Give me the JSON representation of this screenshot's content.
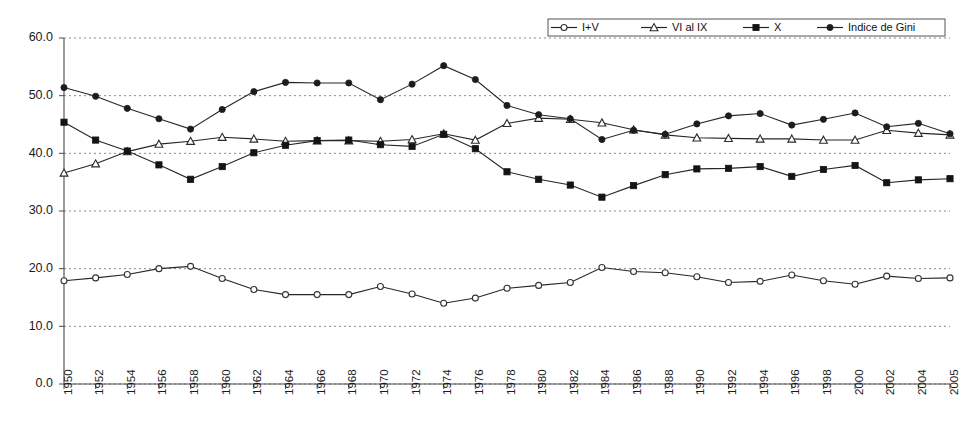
{
  "chart_data": {
    "type": "line",
    "title": "",
    "subtitle": "",
    "xlabel": "",
    "ylabel": "",
    "ylim": [
      0,
      60
    ],
    "yticks": [
      "0.0",
      "10.0",
      "20.0",
      "30.0",
      "40.0",
      "50.0",
      "60.0"
    ],
    "ytick_values": [
      0,
      10,
      20,
      30,
      40,
      50,
      60
    ],
    "grid": "horizontal-dashed",
    "legend_position": "top-right",
    "x": [
      "1950",
      "1952",
      "1954",
      "1956",
      "1958",
      "1960",
      "1962",
      "1964",
      "1966",
      "1968",
      "1970",
      "1972",
      "1974",
      "1976",
      "1978",
      "1980",
      "1982",
      "1984",
      "1986",
      "1988",
      "1990",
      "1992",
      "1994",
      "1996",
      "1998",
      "2000",
      "2002",
      "2004",
      "2005"
    ],
    "categories": [
      "1950",
      "1952",
      "1954",
      "1956",
      "1958",
      "1960",
      "1962",
      "1964",
      "1966",
      "1968",
      "1970",
      "1972",
      "1974",
      "1976",
      "1978",
      "1980",
      "1982",
      "1984",
      "1986",
      "1988",
      "1990",
      "1992",
      "1994",
      "1996",
      "1998",
      "2000",
      "2002",
      "2004",
      "2005"
    ],
    "series": [
      {
        "name": "I+V",
        "marker": "open-circle",
        "values": [
          17.9,
          18.4,
          19.0,
          20.0,
          20.4,
          18.3,
          16.4,
          15.5,
          15.5,
          15.5,
          16.9,
          15.6,
          14.0,
          14.9,
          16.6,
          17.1,
          17.6,
          20.2,
          19.5,
          19.3,
          18.6,
          17.6,
          17.8,
          18.9,
          17.9,
          17.3,
          18.7,
          18.3,
          18.4
        ]
      },
      {
        "name": "VI al IX",
        "marker": "open-triangle",
        "values": [
          36.6,
          38.2,
          40.3,
          41.6,
          42.1,
          42.8,
          42.5,
          42.1,
          42.2,
          42.2,
          42.1,
          42.4,
          43.4,
          42.3,
          45.2,
          46.1,
          45.9,
          45.3,
          44.1,
          43.2,
          42.7,
          42.6,
          42.5,
          42.5,
          42.3,
          42.3,
          44.0,
          43.5,
          43.2
        ]
      },
      {
        "name": "X",
        "marker": "filled-square",
        "values": [
          45.4,
          42.3,
          40.4,
          38.0,
          35.5,
          37.7,
          40.1,
          41.4,
          42.2,
          42.3,
          41.5,
          41.2,
          43.3,
          40.8,
          36.8,
          35.5,
          34.5,
          32.4,
          34.4,
          36.3,
          37.3,
          37.4,
          37.7,
          36.0,
          37.2,
          37.9,
          34.9,
          35.4,
          35.6
        ]
      },
      {
        "name": "Indice de Gini",
        "marker": "filled-circle",
        "values": [
          51.4,
          49.9,
          47.8,
          46.0,
          44.2,
          47.6,
          50.7,
          52.3,
          52.2,
          52.2,
          49.3,
          52.0,
          55.2,
          52.8,
          48.3,
          46.7,
          46.0,
          42.4,
          44.0,
          43.3,
          45.1,
          46.5,
          46.9,
          44.9,
          45.9,
          47.0,
          44.6,
          45.2,
          43.4
        ]
      }
    ],
    "legend": [
      {
        "label": "I+V",
        "marker": "open-circle"
      },
      {
        "label": "VI al IX",
        "marker": "open-triangle"
      },
      {
        "label": "X",
        "marker": "filled-square"
      },
      {
        "label": "Indice de Gini",
        "marker": "filled-circle"
      }
    ],
    "colors": {
      "line": "#262626",
      "grid": "#8a8a8a",
      "axis": "#4a4a4a",
      "background": "#ffffff"
    }
  }
}
